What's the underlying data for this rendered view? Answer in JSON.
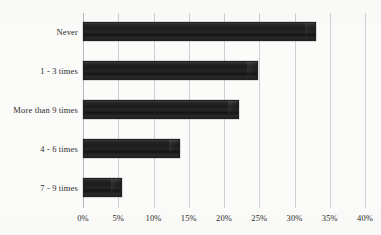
{
  "chart_data": {
    "type": "bar",
    "orientation": "horizontal",
    "title": "",
    "xlabel": "",
    "ylabel": "",
    "categories": [
      "Never",
      "1 - 3 times",
      "More than 9 times",
      "4 - 6 times",
      "7 - 9 times"
    ],
    "values": [
      33.0,
      24.8,
      22.1,
      13.8,
      5.5
    ],
    "value_suffix": "%",
    "xlim": [
      0,
      40
    ],
    "xticks": [
      0,
      5,
      10,
      15,
      20,
      25,
      30,
      35,
      40
    ],
    "xtick_labels": [
      "0%",
      "5%",
      "10%",
      "15%",
      "20%",
      "25%",
      "30%",
      "35%",
      "40%"
    ],
    "grid": "vertical",
    "legend": "none",
    "bar_color": "#1f1f1f",
    "grid_color": "#cfcfcf",
    "text_color": "#2d2d2d",
    "background_color": "#fbfbf9"
  }
}
